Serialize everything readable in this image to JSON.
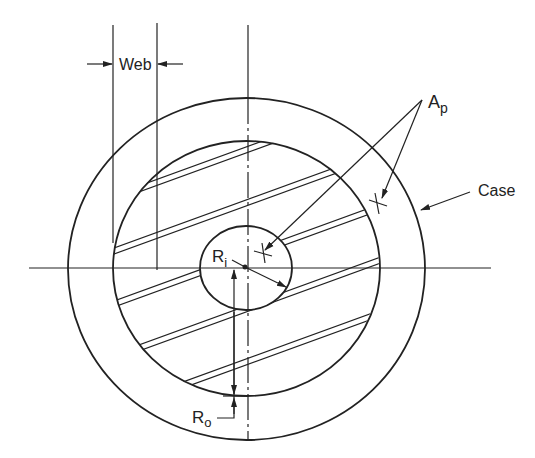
{
  "figure": {
    "labels": {
      "web": "Web",
      "ap_main": "A",
      "ap_sub": "p",
      "case": "Case",
      "ri_main": "R",
      "ri_sub": "i",
      "ro_main": "R",
      "ro_sub": "o"
    },
    "colors": {
      "line": "#222222",
      "background": "#ffffff"
    },
    "geometry": {
      "center": [
        246,
        268
      ],
      "case_radius": [
        178,
        171
      ],
      "grain_radius": [
        133,
        128
      ],
      "bore_radius": [
        46,
        42
      ],
      "slot_angle_deg": -20,
      "slot_gap": 6,
      "slot_center_intercepts": [
        149,
        202,
        255,
        308,
        361
      ]
    }
  }
}
